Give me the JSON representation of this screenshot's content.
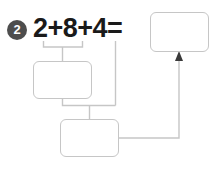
{
  "page": {
    "background_color": "#ffffff",
    "width": 217,
    "height": 173
  },
  "item": {
    "number_label": "2",
    "marker_fill_color": "#4d4d4d",
    "marker_text_color": "#ffffff",
    "equation": "2+8+4=",
    "equation_color": "#1a1a1a",
    "addends": [
      "2",
      "8",
      "4"
    ],
    "operator": "+",
    "equals_sign": "="
  },
  "answer_boxes": [
    {
      "id": "result",
      "value": "",
      "placeholder": "",
      "border_color": "#c6c6c6",
      "fill_color": "#ffffff"
    },
    {
      "id": "partial-1",
      "value": "",
      "placeholder": "",
      "border_color": "#c6c6c6",
      "fill_color": "#ffffff"
    },
    {
      "id": "partial-2",
      "value": "",
      "placeholder": "",
      "border_color": "#c6c6c6",
      "fill_color": "#ffffff"
    }
  ],
  "connectors": {
    "line_color": "#c6c6c6",
    "arrow_color": "#3a3a3a",
    "grouping_bracket_label": "2+8",
    "arrow_target": "result"
  }
}
